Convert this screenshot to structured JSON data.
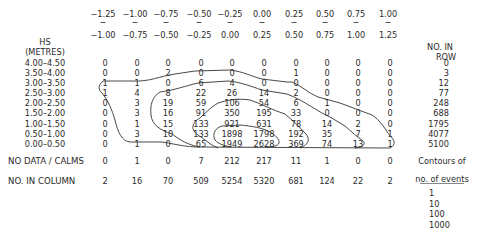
{
  "chart_data": {
    "type": "table",
    "title": "",
    "row_axis_label": [
      "HS",
      "(METRES)"
    ],
    "row_total_label": [
      "NO. IN",
      "ROW"
    ],
    "column_bins": [
      {
        "from": "−1.25",
        "to": "−1.00"
      },
      {
        "from": "−1.00",
        "to": "−0.75"
      },
      {
        "from": "−0.75",
        "to": "−0.50"
      },
      {
        "from": "−0.50",
        "to": "−0.25"
      },
      {
        "from": "−0.25",
        "to": "0.00"
      },
      {
        "from": "0.00",
        "to": "0.25"
      },
      {
        "from": "0.25",
        "to": "0.50"
      },
      {
        "from": "0.50",
        "to": "0.75"
      },
      {
        "from": "0.75",
        "to": "1.00"
      },
      {
        "from": "1.00",
        "to": "1.25"
      }
    ],
    "rows": [
      {
        "label": "4.00–4.50",
        "values": [
          0,
          0,
          0,
          0,
          0,
          0,
          0,
          0,
          0,
          0
        ],
        "total": 0
      },
      {
        "label": "3.50–4.00",
        "values": [
          0,
          0,
          2,
          0,
          0,
          0,
          1,
          0,
          0,
          0
        ],
        "total": 3
      },
      {
        "label": "3.00–3.50",
        "values": [
          1,
          1,
          0,
          6,
          4,
          0,
          0,
          0,
          0,
          0
        ],
        "total": 12
      },
      {
        "label": "2.50–3.00",
        "values": [
          1,
          4,
          8,
          22,
          26,
          14,
          2,
          0,
          0,
          0
        ],
        "total": 77
      },
      {
        "label": "2.00–2.50",
        "values": [
          0,
          3,
          19,
          59,
          106,
          54,
          6,
          1,
          0,
          0
        ],
        "total": 248
      },
      {
        "label": "1.50–2.00",
        "values": [
          0,
          3,
          16,
          91,
          350,
          195,
          33,
          0,
          0,
          0
        ],
        "total": 688
      },
      {
        "label": "1.00–1.50",
        "values": [
          0,
          1,
          15,
          133,
          921,
          631,
          78,
          14,
          2,
          0
        ],
        "total": 1795
      },
      {
        "label": "0.50–1.00",
        "values": [
          0,
          3,
          10,
          133,
          1898,
          1798,
          192,
          35,
          7,
          1
        ],
        "total": 4077
      },
      {
        "label": "0.00–0.50",
        "values": [
          0,
          1,
          0,
          65,
          1949,
          2628,
          369,
          74,
          13,
          1
        ],
        "total": 5100
      }
    ],
    "no_data_calms": {
      "label": "NO DATA / CALMS",
      "values": [
        0,
        1,
        0,
        7,
        212,
        217,
        11,
        1,
        0,
        0
      ]
    },
    "column_totals": {
      "label": "NO. IN COLUMN",
      "values": [
        2,
        16,
        70,
        509,
        5254,
        5320,
        681,
        124,
        22,
        2
      ]
    },
    "legend": {
      "title": [
        "Contours of",
        "no. of events"
      ],
      "levels": [
        "1",
        "10",
        "100",
        "1000"
      ]
    },
    "contour_levels": [
      1,
      10,
      100,
      1000
    ]
  }
}
